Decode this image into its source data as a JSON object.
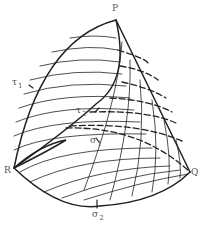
{
  "diagram": {
    "type": "curvilinear-triangle-surface",
    "vertices": {
      "P": {
        "label": "P",
        "x": 116,
        "y": 20
      },
      "Q": {
        "label": "Q",
        "x": 190,
        "y": 172
      },
      "R": {
        "label": "R",
        "x": 14,
        "y": 168
      }
    },
    "curve_labels": {
      "tau1": {
        "symbol": "τ",
        "sub": "1"
      },
      "tau2": {
        "symbol": "τ",
        "sub": "2"
      },
      "sigma1": {
        "symbol": "σ",
        "sub": "1"
      },
      "sigma2": {
        "symbol": "σ",
        "sub": "2"
      }
    },
    "colors": {
      "stroke": "#222222",
      "label": "#555555",
      "background": "#ffffff"
    }
  }
}
